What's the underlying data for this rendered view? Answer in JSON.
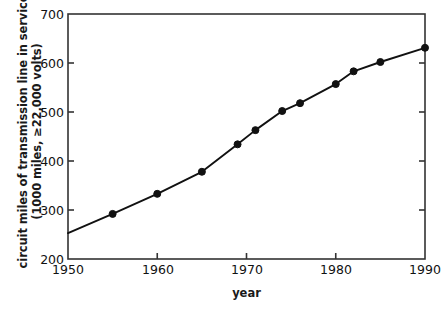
{
  "chart_data": {
    "type": "line",
    "title": "",
    "subtitle": "",
    "xlabel": "year",
    "ylabel": "circuit miles of transmission line in service",
    "ylabel_line2": "(1000 miles, ≥22,000 volts)",
    "ylabel_lines": [
      "circuit miles of transmission line in service",
      "(1000 miles, ≥22,000 volts)"
    ],
    "xlim": [
      1950,
      1990
    ],
    "ylim": [
      200,
      700
    ],
    "xticks": [
      1950,
      1960,
      1970,
      1980,
      1990
    ],
    "yticks": [
      200,
      300,
      400,
      500,
      600,
      700
    ],
    "xtick_labels": [
      "1950",
      "1960",
      "1970",
      "1980",
      "1990"
    ],
    "ytick_labels": [
      "200",
      "300",
      "400",
      "500",
      "600",
      "700"
    ],
    "grid": false,
    "legend": null,
    "legend_position": "none",
    "marker": "filled-circle",
    "line_color": "#111111",
    "marker_color": "#111111",
    "axis_color": "#333333",
    "background_color": "#ffffff",
    "x": [
      1950,
      1955,
      1960,
      1965,
      1969,
      1971,
      1974,
      1976,
      1980,
      1982,
      1985,
      1990
    ],
    "values": [
      253,
      292,
      333,
      378,
      434,
      463,
      502,
      518,
      557,
      583,
      602,
      631
    ],
    "points": [
      {
        "x": 1950,
        "y": 253,
        "marker": false
      },
      {
        "x": 1955,
        "y": 292,
        "marker": true
      },
      {
        "x": 1960,
        "y": 333,
        "marker": true
      },
      {
        "x": 1965,
        "y": 378,
        "marker": true
      },
      {
        "x": 1969,
        "y": 434,
        "marker": true
      },
      {
        "x": 1971,
        "y": 463,
        "marker": true
      },
      {
        "x": 1974,
        "y": 502,
        "marker": true
      },
      {
        "x": 1976,
        "y": 518,
        "marker": true
      },
      {
        "x": 1980,
        "y": 557,
        "marker": true
      },
      {
        "x": 1982,
        "y": 583,
        "marker": true
      },
      {
        "x": 1985,
        "y": 602,
        "marker": true
      },
      {
        "x": 1990,
        "y": 631,
        "marker": true
      }
    ]
  },
  "caption": {
    "text": ""
  }
}
